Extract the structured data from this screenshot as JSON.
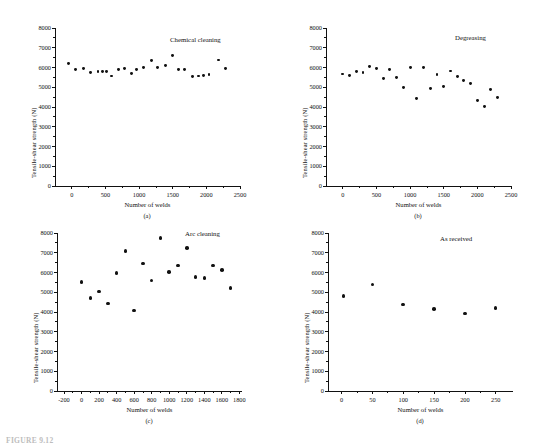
{
  "figure": {
    "caption": "FIGURE 9.12",
    "panels_label_a": "(a)",
    "panels_label_b": "(b)",
    "panels_label_c": "(c)",
    "panels_label_d": "(d)"
  },
  "chart_data": [
    {
      "id": "a",
      "type": "scatter",
      "title": "Chemical cleaning",
      "panel_label": "(a)",
      "xlabel": "Number of welds",
      "ylabel": "Tensile-shear strength (N)",
      "xlim": [
        -250,
        2500
      ],
      "ylim": [
        0,
        8000
      ],
      "xticks": [
        0,
        500,
        1000,
        1500,
        2000,
        2500
      ],
      "yticks": [
        0,
        1000,
        2000,
        3000,
        4000,
        5000,
        6000,
        7000,
        8000
      ],
      "grid": false,
      "legend": "none",
      "x": [
        -50,
        60,
        170,
        280,
        390,
        450,
        510,
        590,
        700,
        780,
        890,
        960,
        1070,
        1180,
        1270,
        1390,
        1500,
        1590,
        1670,
        1790,
        1880,
        1960,
        2040,
        2180,
        2280
      ],
      "y": [
        6200,
        5890,
        5940,
        5760,
        5800,
        5810,
        5810,
        5570,
        5900,
        5940,
        5710,
        5900,
        6010,
        6340,
        6000,
        6100,
        6600,
        5920,
        5890,
        5560,
        5570,
        5610,
        5640,
        6380,
        5970
      ]
    },
    {
      "id": "b",
      "type": "scatter",
      "title": "Degreasing",
      "panel_label": "(b)",
      "xlabel": "Number of welds",
      "ylabel": "Tensile-shear strength (N)",
      "xlim": [
        -250,
        2500
      ],
      "ylim": [
        0,
        8000
      ],
      "xticks": [
        0,
        500,
        1000,
        1500,
        2000,
        2500
      ],
      "yticks": [
        0,
        1000,
        2000,
        3000,
        4000,
        5000,
        6000,
        7000,
        8000
      ],
      "grid": false,
      "legend": "none",
      "x": [
        0,
        100,
        200,
        300,
        400,
        500,
        600,
        700,
        800,
        900,
        1000,
        1100,
        1200,
        1300,
        1400,
        1500,
        1600,
        1700,
        1800,
        1900,
        2000,
        2100,
        2200,
        2300
      ],
      "y": [
        5670,
        5590,
        5800,
        5730,
        6030,
        5940,
        5440,
        5910,
        5500,
        4980,
        5990,
        4430,
        5980,
        4950,
        5660,
        5060,
        5820,
        5540,
        5340,
        5200,
        4340,
        4030,
        4900,
        4480
      ]
    },
    {
      "id": "c",
      "type": "scatter",
      "title": "Arc cleaning",
      "panel_label": "(c)",
      "xlabel": "Number of welds",
      "ylabel": "Tensile-shear strength (N)",
      "xlim": [
        -280,
        1830
      ],
      "ylim": [
        0,
        8000
      ],
      "xticks": [
        -200,
        0,
        200,
        400,
        600,
        800,
        1000,
        1200,
        1400,
        1600,
        1800
      ],
      "yticks": [
        0,
        1000,
        2000,
        3000,
        4000,
        5000,
        6000,
        7000,
        8000
      ],
      "grid": false,
      "legend": "none",
      "x": [
        0,
        100,
        200,
        300,
        400,
        500,
        600,
        700,
        800,
        900,
        1000,
        1100,
        1200,
        1300,
        1400,
        1500,
        1600,
        1700
      ],
      "y": [
        5510,
        4700,
        5030,
        4440,
        5980,
        7080,
        4080,
        6450,
        5600,
        7750,
        6030,
        6360,
        7250,
        5760,
        5730,
        6360,
        6130,
        5220
      ]
    },
    {
      "id": "d",
      "type": "scatter",
      "title": "As received",
      "panel_label": "(d)",
      "xlabel": "Number of welds",
      "ylabel": "Tensile-shear strength (N)",
      "xlim": [
        -22,
        278
      ],
      "ylim": [
        0,
        8000
      ],
      "xticks": [
        0,
        50,
        100,
        150,
        200,
        250
      ],
      "yticks": [
        0,
        1000,
        2000,
        3000,
        4000,
        5000,
        6000,
        7000,
        8000
      ],
      "grid": false,
      "legend": "none",
      "x": [
        3,
        50,
        100,
        150,
        200,
        250
      ],
      "y": [
        4810,
        5400,
        4370,
        4150,
        3920,
        4210
      ]
    }
  ]
}
